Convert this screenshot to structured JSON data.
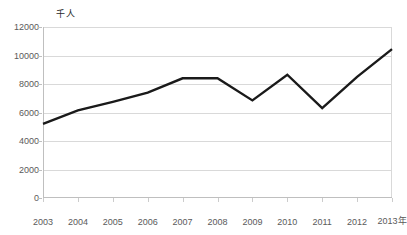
{
  "chart_data": {
    "type": "line",
    "title": "",
    "subtitle": "",
    "xlabel": "年",
    "ylabel": "千人",
    "y_unit_caption": "千人",
    "x_axis_suffix": "年",
    "categories": [
      "2003",
      "2004",
      "2005",
      "2006",
      "2007",
      "2008",
      "2009",
      "2010",
      "2011",
      "2012",
      "2013"
    ],
    "x_tick_labels": [
      "2003",
      "2004",
      "2005",
      "2006",
      "2007",
      "2008",
      "2009",
      "2010",
      "2011",
      "2012",
      "2013年"
    ],
    "values": [
      5200,
      6150,
      6750,
      7400,
      8400,
      8400,
      6850,
      8650,
      6300,
      8500,
      10450
    ],
    "series": [
      {
        "name": "",
        "color": "#1a1a1a",
        "values": [
          5200,
          6150,
          6750,
          7400,
          8400,
          8400,
          6850,
          8650,
          6300,
          8500,
          10450
        ]
      }
    ],
    "ylim": [
      0,
      12000
    ],
    "y_ticks": [
      0,
      2000,
      4000,
      6000,
      8000,
      10000,
      12000
    ],
    "y_tick_labels": [
      "0",
      "2000",
      "4000",
      "6000",
      "8000",
      "10000",
      "12000"
    ],
    "xlim": [
      2003,
      2013
    ],
    "grid": true,
    "grid_axis": "y",
    "legend": false,
    "legend_position": "none",
    "markers": false,
    "line_width": 2.4
  },
  "colors": {
    "line": "#1a1a1a",
    "grid": "#d9d9d9",
    "axis": "#bfbfbf",
    "tick_text": "#5a5a5a",
    "unit_text": "#2b2b2b",
    "background": "#ffffff"
  }
}
